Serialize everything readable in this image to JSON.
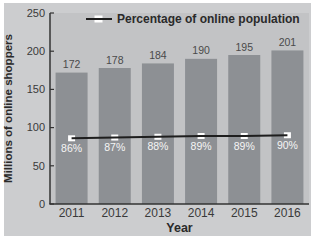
{
  "figure": {
    "legend_label": "Percentage of online population",
    "x_axis_title": "Year",
    "y_axis_title": "Millions of online shoppers"
  },
  "colors": {
    "page_bg": "#ffffff",
    "card_bg": "#cccdcf",
    "plot_bg": "#c2c3c5",
    "bar": "#8d9094",
    "axis": "#333333",
    "tick_text": "#3a3a3a",
    "bar_label_text": "#4a4a4a",
    "pct_label_text": "#f5f5f5",
    "line": "#1e1e1e",
    "marker_fill": "#ffffff",
    "bold_text": "#2a2a2a"
  },
  "chart_data": {
    "type": "bar",
    "title": "",
    "categories": [
      "2011",
      "2012",
      "2013",
      "2014",
      "2015",
      "2016"
    ],
    "series": [
      {
        "name": "Millions of online shoppers",
        "type": "bar",
        "values": [
          172,
          178,
          184,
          190,
          195,
          201
        ],
        "labels": [
          "172",
          "178",
          "184",
          "190",
          "195",
          "201"
        ]
      },
      {
        "name": "Percentage of online population",
        "type": "line",
        "values": [
          86,
          87,
          88,
          89,
          89,
          90
        ],
        "labels": [
          "86%",
          "87%",
          "88%",
          "89%",
          "89%",
          "90%"
        ]
      }
    ],
    "xlabel": "Year",
    "ylabel": "Millions of online shoppers",
    "ylim": [
      0,
      250
    ],
    "yticks": [
      0,
      50,
      100,
      150,
      200,
      250
    ],
    "grid": false,
    "legend": {
      "entries": [
        "Percentage of online population"
      ],
      "position": "top"
    }
  }
}
